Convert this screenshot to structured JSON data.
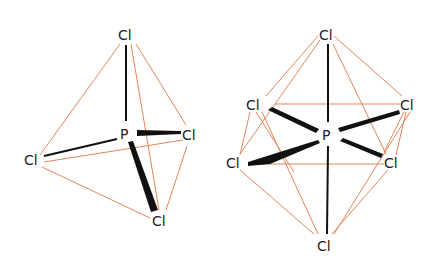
{
  "diagram": {
    "colors": {
      "edge": "#e0875a",
      "bond": "#111111",
      "label": "#222222"
    },
    "pcl5": {
      "center": "P",
      "labels": {
        "top": "Cl",
        "right": "Cl",
        "left": "Cl",
        "bottom": "Cl"
      }
    },
    "pcl6": {
      "center": "P",
      "labels": {
        "top": "Cl",
        "upper_left": "Cl",
        "upper_right": "Cl",
        "lower_left": "Cl",
        "lower_right": "Cl",
        "bottom": "Cl"
      }
    }
  }
}
